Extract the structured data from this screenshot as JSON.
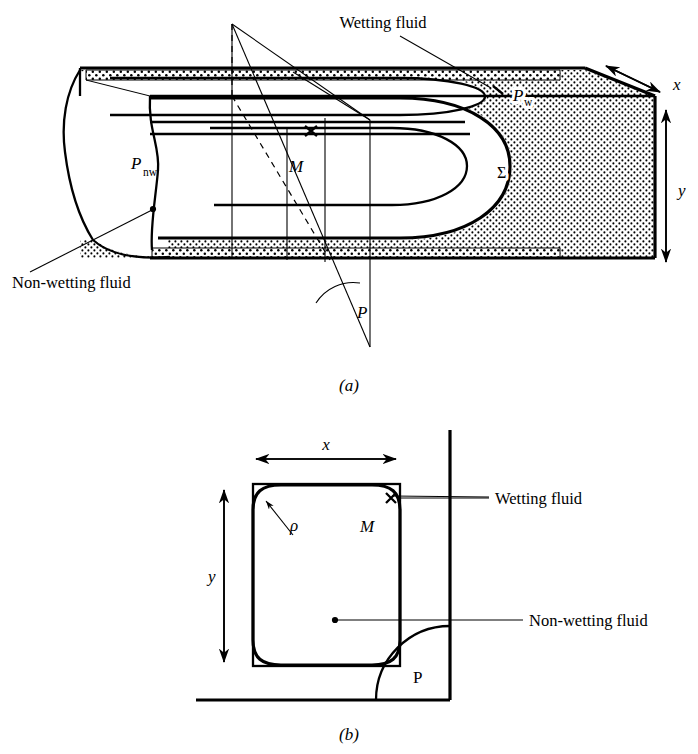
{
  "figure": {
    "captions": {
      "a": "(a)",
      "b": "(b)"
    }
  },
  "colors": {
    "ink": "#000000",
    "paper": "#ffffff",
    "stipple": "#000000"
  },
  "panel_a": {
    "name": "three-dimensional-pore-block",
    "labels": {
      "wetting_fluid": "Wetting fluid",
      "non_wetting_fluid": "Non-wetting fluid",
      "pressure_wetting": "P",
      "pressure_wetting_sub": "w",
      "pressure_non_wetting": "P",
      "pressure_non_wetting_sub": "nw",
      "interface": "Σ",
      "point_m": "M",
      "angle_p": "P",
      "axis_x": "x",
      "axis_y": "y"
    }
  },
  "panel_b": {
    "name": "pore-cross-section",
    "labels": {
      "wetting_fluid": "Wetting fluid",
      "non_wetting_fluid": "Non-wetting fluid",
      "radius": "ρ",
      "point_m": "M",
      "angle_p": "P",
      "axis_x": "x",
      "axis_y": "y"
    }
  }
}
